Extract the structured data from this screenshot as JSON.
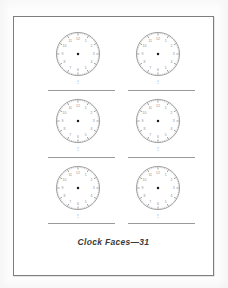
{
  "page": {
    "caption": "Clock Faces—31",
    "background_color": "#fdfdfd",
    "sheet_color": "#ffffff",
    "border_color": "#7e7e7e",
    "rule_color": "#9a9a9a",
    "ink_color": "#6b6b6b"
  },
  "clock_template": {
    "numerals": [
      "12",
      "1",
      "2",
      "3",
      "4",
      "5",
      "6",
      "7",
      "8",
      "9",
      "10",
      "11"
    ],
    "minute_tick_count": 60,
    "hour_tick_count": 12,
    "has_center_dot": true,
    "has_hands": false,
    "rim_color": "#6f6f6f",
    "tick_color": "#7a7a7a",
    "numeral_color": "#8d8d8d",
    "center_dot_color": "#1d1d1d"
  },
  "clocks": [
    {
      "id": "clock-1",
      "row": 1,
      "column": 1,
      "label": "",
      "under_mark": "⋮"
    },
    {
      "id": "clock-2",
      "row": 1,
      "column": 2,
      "label": "",
      "under_mark": "⋮"
    },
    {
      "id": "clock-3",
      "row": 2,
      "column": 1,
      "label": "",
      "under_mark": "⋮"
    },
    {
      "id": "clock-4",
      "row": 2,
      "column": 2,
      "label": "",
      "under_mark": "⋮"
    },
    {
      "id": "clock-5",
      "row": 3,
      "column": 1,
      "label": "",
      "under_mark": "⋮"
    },
    {
      "id": "clock-6",
      "row": 3,
      "column": 2,
      "label": "",
      "under_mark": "⋮"
    }
  ],
  "rules": [
    {
      "id": "rule-row1-left",
      "x": 35,
      "y": 74,
      "width": 67
    },
    {
      "id": "rule-row1-right",
      "x": 115,
      "y": 74,
      "width": 67
    },
    {
      "id": "rule-row2-left",
      "x": 35,
      "y": 141,
      "width": 67
    },
    {
      "id": "rule-row2-right",
      "x": 115,
      "y": 141,
      "width": 67
    },
    {
      "id": "rule-row3-left",
      "x": 35,
      "y": 207,
      "width": 67
    },
    {
      "id": "rule-row3-right",
      "x": 115,
      "y": 207,
      "width": 67
    }
  ]
}
